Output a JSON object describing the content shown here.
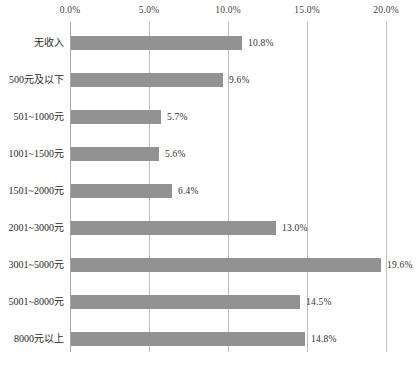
{
  "chart_data": {
    "type": "bar",
    "orientation": "horizontal",
    "title": "",
    "categories": [
      "无收入",
      "500元及以下",
      "501~1000元",
      "1001~1500元",
      "1501~2000元",
      "2001~3000元",
      "3001~5000元",
      "5001~8000元",
      "8000元以上"
    ],
    "values": [
      10.8,
      9.6,
      5.7,
      5.6,
      6.4,
      13.0,
      19.6,
      14.5,
      14.8
    ],
    "value_labels": [
      "10.8%",
      "9.6%",
      "5.7%",
      "5.6%",
      "6.4%",
      "13.0%",
      "19.6%",
      "14.5%",
      "14.8%"
    ],
    "x_axis": {
      "position": "top",
      "min": 0,
      "max": 20,
      "tick_step": 5,
      "tick_labels": [
        "0.0%",
        "5.0%",
        "10.0%",
        "15.0%",
        "20.0%"
      ]
    },
    "grid": true,
    "legend": "none",
    "colors": {
      "bar": "#929292",
      "gridline": "#bfbfbf",
      "zero_axis": "#a8a8a8",
      "text": "#2b2b2b",
      "background": "#ffffff"
    }
  }
}
